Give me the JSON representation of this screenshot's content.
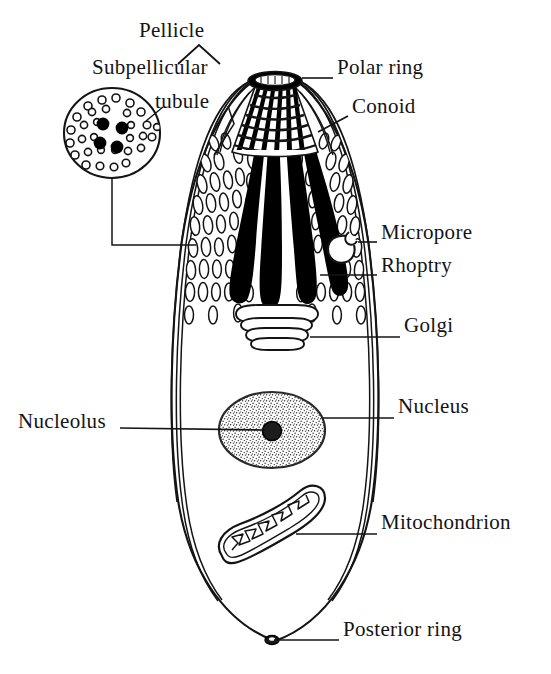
{
  "figure": {
    "style": {
      "ink": "#141414",
      "background": "#ffffff",
      "fill_light": "#ffffff",
      "fill_dark": "#000000",
      "stipple": "#3a3a3a"
    }
  },
  "labels": [
    {
      "id": "pellicle",
      "text": "Pellicle",
      "x": 139,
      "y": 29,
      "anchor": "start",
      "leader": "bracket-up"
    },
    {
      "id": "subpellicular_tubule",
      "text": "Subpellicular",
      "x": 92,
      "y": 66,
      "anchor": "start",
      "leader": "elbow"
    },
    {
      "id": "tubule_line2",
      "text": "tubule",
      "x": 155,
      "y": 100,
      "anchor": "start",
      "leader": "none"
    },
    {
      "id": "polar_ring",
      "text": "Polar ring",
      "x": 337,
      "y": 66,
      "anchor": "start",
      "leader": "straight-left"
    },
    {
      "id": "conoid",
      "text": "Conoid",
      "x": 352,
      "y": 105,
      "anchor": "start",
      "leader": "straight-left"
    },
    {
      "id": "micropore",
      "text": "Micropore",
      "x": 381,
      "y": 231,
      "anchor": "start",
      "leader": "straight-left"
    },
    {
      "id": "rhoptry",
      "text": "Rhoptry",
      "x": 381,
      "y": 264,
      "anchor": "start",
      "leader": "straight-left"
    },
    {
      "id": "golgi",
      "text": "Golgi",
      "x": 404,
      "y": 324,
      "anchor": "start",
      "leader": "straight-left"
    },
    {
      "id": "nucleus",
      "text": "Nucleus",
      "x": 398,
      "y": 405,
      "anchor": "start",
      "leader": "straight-left"
    },
    {
      "id": "nucleolus",
      "text": "Nucleolus",
      "x": 18,
      "y": 420,
      "anchor": "start",
      "leader": "straight-right"
    },
    {
      "id": "mitochondrion",
      "text": "Mitochondrion",
      "x": 381,
      "y": 521,
      "anchor": "start",
      "leader": "straight-left"
    },
    {
      "id": "posterior_ring",
      "text": "Posterior ring",
      "x": 343,
      "y": 628,
      "anchor": "start",
      "leader": "straight-left"
    }
  ],
  "structures": [
    {
      "id": "cell-body",
      "name": "Cell body outline"
    },
    {
      "id": "pellicle-membrane",
      "name": "Pellicle (triple membrane)"
    },
    {
      "id": "conoid-cone",
      "name": "Conoid"
    },
    {
      "id": "polar-ring-ellipse",
      "name": "Polar ring"
    },
    {
      "id": "rhoptries",
      "name": "Rhoptries",
      "count": 4
    },
    {
      "id": "subpellicular-tubules",
      "name": "Subpellicular tubules"
    },
    {
      "id": "micropore-pore",
      "name": "Micropore"
    },
    {
      "id": "golgi-stack",
      "name": "Golgi apparatus",
      "cisternae": 4
    },
    {
      "id": "nucleus-oval",
      "name": "Nucleus"
    },
    {
      "id": "nucleolus-dot",
      "name": "Nucleolus"
    },
    {
      "id": "mitochondrion-body",
      "name": "Mitochondrion"
    },
    {
      "id": "posterior-ring-knot",
      "name": "Posterior ring"
    },
    {
      "id": "cross-section-inset",
      "name": "Cross-section inset",
      "dark_tubules": 4
    }
  ]
}
